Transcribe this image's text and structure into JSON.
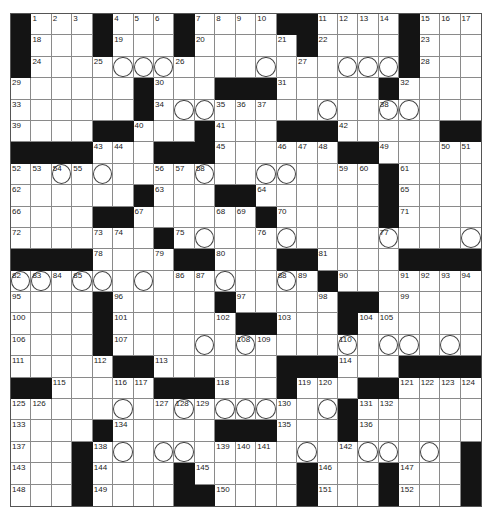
{
  "puzzle": {
    "rows": 23,
    "cols": 23,
    "grid": [
      "#...#...#....##....#...",
      "#...#...#.....#....#...",
      "#..................#...",
      "......#...###.....#....",
      "......#................",
      "....##...#...###.....##",
      "####...###......##.....",
      "..................#....",
      "......#...##......#....",
      "....##......#.....#....",
      ".......#...............",
      "####....##...##....####",
      "...............#.......",
      "....#.....#.....##.....",
      "....#......##...#......",
      "....#..................",
      ".....##......###...####",
      "##.....###...#...##....",
      "................#......",
      "....#.....###...#......",
      "...#..................#",
      "...#....#.....#...#...#",
      "...#....##....#...#...#"
    ],
    "numbers": [
      [
        0,
        1,
        1
      ],
      [
        0,
        2,
        2
      ],
      [
        0,
        3,
        3
      ],
      [
        0,
        5,
        4
      ],
      [
        0,
        6,
        5
      ],
      [
        0,
        7,
        6
      ],
      [
        0,
        9,
        7
      ],
      [
        0,
        10,
        8
      ],
      [
        0,
        11,
        9
      ],
      [
        0,
        12,
        10
      ],
      [
        0,
        15,
        11
      ],
      [
        0,
        16,
        12
      ],
      [
        0,
        17,
        13
      ],
      [
        0,
        18,
        14
      ],
      [
        0,
        20,
        15
      ],
      [
        0,
        21,
        16
      ],
      [
        0,
        22,
        17
      ],
      [
        1,
        1,
        18
      ],
      [
        1,
        5,
        19
      ],
      [
        1,
        9,
        20
      ],
      [
        1,
        13,
        21
      ],
      [
        1,
        15,
        22
      ],
      [
        1,
        20,
        23
      ],
      [
        2,
        1,
        24
      ],
      [
        2,
        4,
        25
      ],
      [
        2,
        8,
        26
      ],
      [
        2,
        14,
        27
      ],
      [
        2,
        20,
        28
      ],
      [
        3,
        0,
        29
      ],
      [
        3,
        7,
        30
      ],
      [
        3,
        13,
        31
      ],
      [
        3,
        19,
        32
      ],
      [
        4,
        0,
        33
      ],
      [
        4,
        7,
        34
      ],
      [
        4,
        10,
        35
      ],
      [
        4,
        11,
        36
      ],
      [
        4,
        12,
        37
      ],
      [
        4,
        18,
        38
      ],
      [
        5,
        0,
        39
      ],
      [
        5,
        6,
        40
      ],
      [
        5,
        10,
        41
      ],
      [
        5,
        16,
        42
      ],
      [
        6,
        4,
        43
      ],
      [
        6,
        5,
        44
      ],
      [
        6,
        10,
        45
      ],
      [
        6,
        13,
        46
      ],
      [
        6,
        14,
        47
      ],
      [
        6,
        15,
        48
      ],
      [
        6,
        18,
        49
      ],
      [
        6,
        21,
        50
      ],
      [
        6,
        22,
        51
      ],
      [
        7,
        0,
        52
      ],
      [
        7,
        1,
        53
      ],
      [
        7,
        2,
        54
      ],
      [
        7,
        3,
        55
      ],
      [
        7,
        7,
        56
      ],
      [
        7,
        8,
        57
      ],
      [
        7,
        9,
        58
      ],
      [
        7,
        16,
        59
      ],
      [
        7,
        17,
        60
      ],
      [
        7,
        19,
        61
      ],
      [
        8,
        0,
        62
      ],
      [
        8,
        7,
        63
      ],
      [
        8,
        12,
        64
      ],
      [
        8,
        19,
        65
      ],
      [
        9,
        0,
        66
      ],
      [
        9,
        6,
        67
      ],
      [
        9,
        10,
        68
      ],
      [
        9,
        11,
        69
      ],
      [
        9,
        13,
        70
      ],
      [
        9,
        19,
        71
      ],
      [
        10,
        0,
        72
      ],
      [
        10,
        4,
        73
      ],
      [
        10,
        5,
        74
      ],
      [
        10,
        8,
        75
      ],
      [
        10,
        12,
        76
      ],
      [
        10,
        18,
        77
      ],
      [
        11,
        4,
        78
      ],
      [
        11,
        7,
        79
      ],
      [
        11,
        10,
        80
      ],
      [
        11,
        15,
        81
      ],
      [
        12,
        0,
        82
      ],
      [
        12,
        1,
        83
      ],
      [
        12,
        2,
        84
      ],
      [
        12,
        3,
        85
      ],
      [
        12,
        8,
        86
      ],
      [
        12,
        9,
        87
      ],
      [
        12,
        13,
        88
      ],
      [
        12,
        14,
        89
      ],
      [
        12,
        16,
        90
      ],
      [
        12,
        19,
        91
      ],
      [
        12,
        20,
        92
      ],
      [
        12,
        21,
        93
      ],
      [
        12,
        22,
        94
      ],
      [
        13,
        0,
        95
      ],
      [
        13,
        5,
        96
      ],
      [
        13,
        11,
        97
      ],
      [
        13,
        15,
        98
      ],
      [
        13,
        19,
        99
      ],
      [
        14,
        0,
        100
      ],
      [
        14,
        5,
        101
      ],
      [
        14,
        10,
        102
      ],
      [
        14,
        13,
        103
      ],
      [
        14,
        17,
        104
      ],
      [
        14,
        18,
        105
      ],
      [
        15,
        0,
        106
      ],
      [
        15,
        5,
        107
      ],
      [
        15,
        11,
        108
      ],
      [
        15,
        12,
        109
      ],
      [
        15,
        16,
        110
      ],
      [
        16,
        0,
        111
      ],
      [
        16,
        4,
        112
      ],
      [
        16,
        7,
        113
      ],
      [
        16,
        16,
        114
      ],
      [
        17,
        2,
        115
      ],
      [
        17,
        5,
        116
      ],
      [
        17,
        6,
        117
      ],
      [
        17,
        10,
        118
      ],
      [
        17,
        14,
        119
      ],
      [
        17,
        15,
        120
      ],
      [
        17,
        19,
        121
      ],
      [
        17,
        20,
        122
      ],
      [
        17,
        21,
        123
      ],
      [
        17,
        22,
        124
      ],
      [
        18,
        0,
        125
      ],
      [
        18,
        1,
        126
      ],
      [
        18,
        7,
        127
      ],
      [
        18,
        8,
        128
      ],
      [
        18,
        9,
        129
      ],
      [
        18,
        13,
        130
      ],
      [
        18,
        17,
        131
      ],
      [
        18,
        18,
        132
      ],
      [
        19,
        0,
        133
      ],
      [
        19,
        5,
        134
      ],
      [
        19,
        13,
        135
      ],
      [
        19,
        17,
        136
      ],
      [
        20,
        0,
        137
      ],
      [
        20,
        4,
        138
      ],
      [
        20,
        10,
        139
      ],
      [
        20,
        11,
        140
      ],
      [
        20,
        12,
        141
      ],
      [
        20,
        16,
        142
      ],
      [
        21,
        0,
        143
      ],
      [
        21,
        4,
        144
      ],
      [
        21,
        9,
        145
      ],
      [
        21,
        15,
        146
      ],
      [
        21,
        19,
        147
      ],
      [
        22,
        0,
        148
      ],
      [
        22,
        4,
        149
      ],
      [
        22,
        10,
        150
      ],
      [
        22,
        15,
        151
      ],
      [
        22,
        19,
        152
      ]
    ],
    "circles": [
      [
        2,
        5
      ],
      [
        2,
        6
      ],
      [
        2,
        7
      ],
      [
        2,
        12
      ],
      [
        2,
        16
      ],
      [
        2,
        17
      ],
      [
        2,
        18
      ],
      [
        4,
        8
      ],
      [
        4,
        9
      ],
      [
        4,
        15
      ],
      [
        4,
        18
      ],
      [
        4,
        19
      ],
      [
        7,
        2
      ],
      [
        7,
        4
      ],
      [
        7,
        9
      ],
      [
        7,
        12
      ],
      [
        7,
        13
      ],
      [
        10,
        9
      ],
      [
        10,
        13
      ],
      [
        10,
        18
      ],
      [
        10,
        22
      ],
      [
        12,
        0
      ],
      [
        12,
        1
      ],
      [
        12,
        3
      ],
      [
        12,
        4
      ],
      [
        12,
        6
      ],
      [
        12,
        10
      ],
      [
        12,
        13
      ],
      [
        15,
        9
      ],
      [
        15,
        11
      ],
      [
        15,
        16
      ],
      [
        15,
        18
      ],
      [
        15,
        19
      ],
      [
        15,
        21
      ],
      [
        18,
        5
      ],
      [
        18,
        8
      ],
      [
        18,
        10
      ],
      [
        18,
        11
      ],
      [
        18,
        12
      ],
      [
        18,
        15
      ],
      [
        20,
        5
      ],
      [
        20,
        7
      ],
      [
        20,
        8
      ],
      [
        20,
        14
      ],
      [
        20,
        17
      ],
      [
        20,
        18
      ],
      [
        20,
        20
      ]
    ]
  }
}
